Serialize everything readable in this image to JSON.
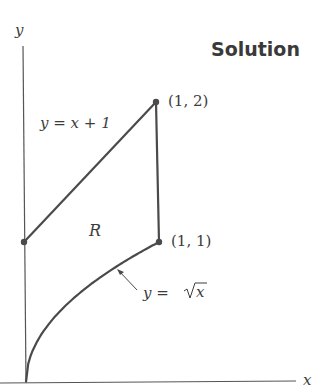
{
  "heading": "Solution",
  "axes": {
    "x_label": "x",
    "y_label": "y"
  },
  "points": [
    {
      "name": "A",
      "x": 0,
      "y": 1,
      "label": ""
    },
    {
      "name": "B",
      "x": 1,
      "y": 2,
      "label": "(1, 2)"
    },
    {
      "name": "C",
      "x": 1,
      "y": 1,
      "label": "(1, 1)"
    }
  ],
  "curves": {
    "line": {
      "label": "y = x + 1"
    },
    "sqrt": {
      "label_lhs": "y = ",
      "label_rad": "x"
    }
  },
  "region_label": "R",
  "colors": {
    "stroke": "#4a4a4a",
    "text": "#3c3c3c",
    "heading": "#3a3a3a"
  }
}
